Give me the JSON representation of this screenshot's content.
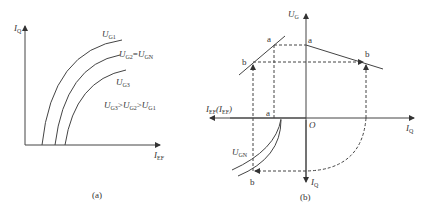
{
  "panel_a": {
    "caption": "(a)",
    "y_axis": {
      "var": "I",
      "sub": "Q"
    },
    "x_axis": {
      "var": "I",
      "sub": "EF"
    },
    "curves": [
      {
        "var": "U",
        "sub": "G1"
      },
      {
        "var": "U",
        "sub": "G2",
        "eq": "=",
        "var2": "U",
        "sub2": "GN"
      },
      {
        "var": "U",
        "sub": "G3"
      }
    ],
    "relation": {
      "a": "G3",
      "b": "G2",
      "c": "G1"
    }
  },
  "panel_b": {
    "caption": "(b)",
    "y_axis_up": {
      "var": "U",
      "sub": "G"
    },
    "y_axis_down": {
      "var": "I",
      "sub": "Q"
    },
    "x_axis_right": {
      "var": "I",
      "sub": "Q"
    },
    "x_axis_left": {
      "var": "I",
      "sub": "EF",
      "paren_sub": "EF"
    },
    "origin": "O",
    "curve_label": {
      "var": "U",
      "sub": "GN"
    },
    "points": [
      "a",
      "b",
      "a",
      "b",
      "a",
      "b"
    ]
  }
}
